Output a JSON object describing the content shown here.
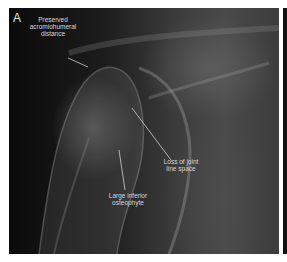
{
  "figure": {
    "panel_label": "A",
    "annotations": [
      {
        "text": "Preserved\nacromiohumeral\ndistance"
      },
      {
        "text": "Loss of joint\nline space"
      },
      {
        "text": "Large inferior\nosteophyte"
      }
    ],
    "colors": {
      "background": "#ffffff",
      "label_text": "#d8d8d8",
      "leader_line": "#d0d0d0"
    }
  }
}
